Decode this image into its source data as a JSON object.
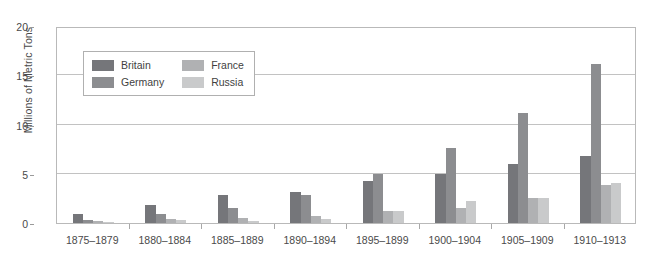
{
  "chart_data": {
    "type": "bar",
    "title": "",
    "xlabel": "",
    "ylabel": "Millions of Metric Tons",
    "ylim": [
      0,
      20
    ],
    "yticks": [
      0,
      5,
      10,
      15,
      20
    ],
    "grid": true,
    "legend_position": "upper-left-inside",
    "categories": [
      "1875–1879",
      "1880–1884",
      "1885–1889",
      "1890–1894",
      "1895–1899",
      "1900–1904",
      "1905–1909",
      "1910–1913"
    ],
    "series": [
      {
        "name": "Britain",
        "color": "#75767a",
        "values": [
          0.9,
          1.8,
          2.8,
          3.1,
          4.3,
          5.0,
          6.0,
          6.8
        ]
      },
      {
        "name": "Germany",
        "color": "#8c8d90",
        "values": [
          0.3,
          0.9,
          1.5,
          2.8,
          5.0,
          7.6,
          11.2,
          16.1
        ]
      },
      {
        "name": "France",
        "color": "#b0b1b3",
        "values": [
          0.2,
          0.4,
          0.5,
          0.7,
          1.2,
          1.5,
          2.5,
          3.9
        ]
      },
      {
        "name": "Russia",
        "color": "#c9cacb",
        "values": [
          0.1,
          0.3,
          0.2,
          0.4,
          1.2,
          2.2,
          2.5,
          4.1
        ]
      }
    ]
  },
  "legend": {
    "items": [
      {
        "label": "Britain",
        "color": "#75767a"
      },
      {
        "label": "France",
        "color": "#b0b1b3"
      },
      {
        "label": "Germany",
        "color": "#8c8d90"
      },
      {
        "label": "Russia",
        "color": "#c9cacb"
      }
    ]
  },
  "axis": {
    "y_title": "Millions of Metric Tons"
  }
}
